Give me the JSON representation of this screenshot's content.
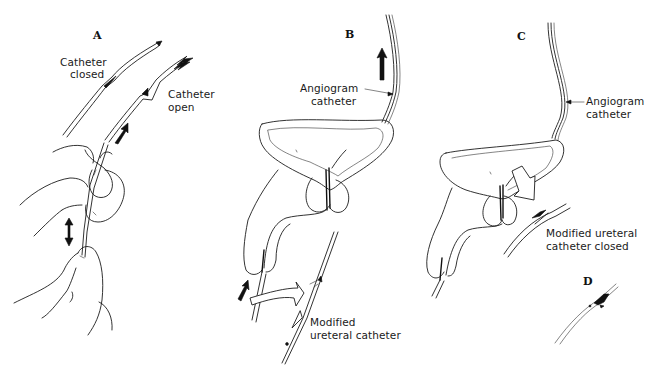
{
  "figure": {
    "panels": [
      {
        "id": "A",
        "label": "A",
        "annotations": {
          "catheter_closed_line1": "Catheter",
          "catheter_closed_line2": "closed",
          "catheter_open_line1": "Catheter",
          "catheter_open_line2": "open"
        }
      },
      {
        "id": "B",
        "label": "B",
        "annotations": {
          "angiogram_line1": "Angiogram",
          "angiogram_line2": "catheter",
          "modified_line1": "Modified",
          "modified_line2": "ureteral catheter"
        }
      },
      {
        "id": "C",
        "label": "C",
        "annotations": {
          "angiogram_line1": "Angiogram",
          "angiogram_line2": "catheter",
          "modified_closed_line1": "Modified ureteral",
          "modified_closed_line2": "catheter closed"
        }
      },
      {
        "id": "D",
        "label": "D"
      }
    ],
    "icons": {
      "direction_arrows": [
        "arrow-down-left-icon",
        "arrow-up-right-icon",
        "double-arrow-vertical-icon",
        "arrow-up-icon",
        "hollow-curved-arrow-icon"
      ]
    },
    "colors": {
      "ink": "#1c1c1c",
      "paper": "#ffffff"
    }
  }
}
